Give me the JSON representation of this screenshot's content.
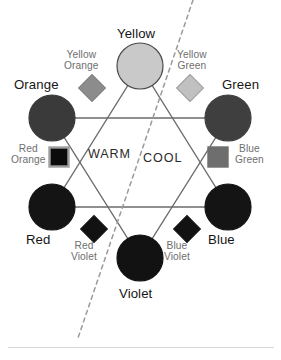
{
  "diagram": {
    "type": "color-wheel-hexagram",
    "canvas": {
      "width": 281,
      "height": 360,
      "background": "#ffffff"
    },
    "stroke_color": "#6b6b6b",
    "divider": {
      "label_warm": "WARM",
      "label_cool": "COOL",
      "style": "dashed",
      "color": "#9a9a9a",
      "x1": 193,
      "y1": 0,
      "x2": 78,
      "y2": 338
    },
    "temperature_labels": [
      {
        "id": "warm",
        "text": "WARM",
        "x": 88,
        "y": 148
      },
      {
        "id": "cool",
        "text": "COOL",
        "x": 143,
        "y": 152
      }
    ],
    "primary_secondary": [
      {
        "id": "yellow",
        "label": "Yellow",
        "color": "#c9c9c9",
        "stroke": "#4a4a4a",
        "cx": 140,
        "cy": 66,
        "r": 23,
        "label_x": 117,
        "label_y": 27,
        "label_align": "center"
      },
      {
        "id": "orange",
        "label": "Orange",
        "color": "#3a3a3a",
        "stroke": "#3a3a3a",
        "cx": 52,
        "cy": 118,
        "r": 23,
        "label_x": 14,
        "label_y": 78,
        "label_align": "left"
      },
      {
        "id": "green",
        "label": "Green",
        "color": "#3f3f3f",
        "stroke": "#3f3f3f",
        "cx": 228,
        "cy": 118,
        "r": 23,
        "label_x": 222,
        "label_y": 78,
        "label_align": "left"
      },
      {
        "id": "red",
        "label": "Red",
        "color": "#141414",
        "stroke": "#141414",
        "cx": 52,
        "cy": 207,
        "r": 23,
        "label_x": 26,
        "label_y": 233,
        "label_align": "left"
      },
      {
        "id": "blue",
        "label": "Blue",
        "color": "#141414",
        "stroke": "#141414",
        "cx": 228,
        "cy": 207,
        "r": 23,
        "label_x": 208,
        "label_y": 233,
        "label_align": "left"
      },
      {
        "id": "violet",
        "label": "Violet",
        "color": "#121212",
        "stroke": "#121212",
        "cx": 140,
        "cy": 258,
        "r": 23,
        "label_x": 119,
        "label_y": 287,
        "label_align": "center"
      }
    ],
    "tertiary": [
      {
        "id": "yellow-orange",
        "label_line1": "Yellow",
        "label_line2": "Orange",
        "color": "#8c8c8c",
        "stroke": "#7d7d7d",
        "shape": "diamond",
        "cx": 92,
        "cy": 88,
        "size": 19,
        "label_x": 64,
        "label_y": 49
      },
      {
        "id": "yellow-green",
        "label_line1": "Yellow",
        "label_line2": "Green",
        "color": "#c0c0c0",
        "stroke": "#9a9a9a",
        "shape": "diamond",
        "cx": 190,
        "cy": 88,
        "size": 19,
        "label_x": 177,
        "label_y": 49
      },
      {
        "id": "red-orange",
        "label_line1": "Red",
        "label_line2": "Orange",
        "color": "#0b0b0b",
        "stroke": "#9e9e9e",
        "shape": "square",
        "cx": 59,
        "cy": 157,
        "size": 19,
        "label_x": 11,
        "label_y": 143
      },
      {
        "id": "blue-green",
        "label_line1": "Blue",
        "label_line2": "Green",
        "color": "#6e6e6e",
        "stroke": "#6e6e6e",
        "shape": "square",
        "cx": 218,
        "cy": 157,
        "size": 19,
        "label_x": 235,
        "label_y": 143
      },
      {
        "id": "red-violet",
        "label_line1": "Red",
        "label_line2": "Violet",
        "color": "#121212",
        "stroke": "#121212",
        "shape": "diamond",
        "cx": 94,
        "cy": 229,
        "size": 19,
        "label_x": 71,
        "label_y": 240
      },
      {
        "id": "blue-violet",
        "label_line1": "Blue",
        "label_line2": "Violet",
        "color": "#121212",
        "stroke": "#121212",
        "shape": "diamond",
        "cx": 187,
        "cy": 229,
        "size": 19,
        "label_x": 164,
        "label_y": 240
      }
    ],
    "triangles": [
      {
        "id": "warm-triangle",
        "points": "140,66 52,207 228,207"
      },
      {
        "id": "cool-triangle",
        "points": "52,118 228,118 140,258"
      }
    ],
    "footer_rule": {
      "x": 8,
      "y": 347,
      "width": 266,
      "color": "#d8d8d8"
    }
  }
}
